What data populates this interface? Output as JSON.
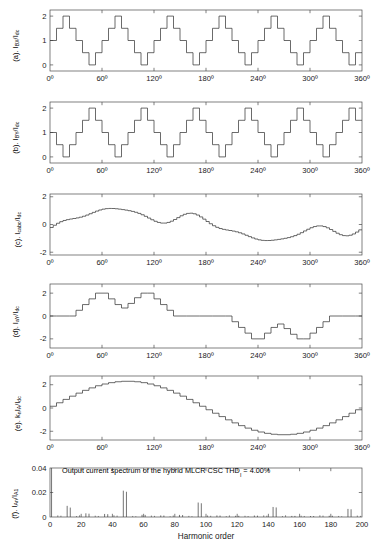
{
  "figure": {
    "width": 377,
    "height": 547,
    "background": "#ffffff",
    "line_color": "#3a3a3a",
    "axis_color": "#4a4a4a",
    "text_color": "#1a1a1a"
  },
  "xaxis_title": "Harmonic order",
  "angle_ticks": [
    "0º",
    "60º",
    "120º",
    "180º",
    "240º",
    "300º",
    "360º"
  ],
  "angle_tick_values": [
    0,
    60,
    120,
    180,
    240,
    300,
    360
  ],
  "annotation": {
    "text_part1": "Output current spectrum of the hybrid MLCR CSC THD",
    "subscript": "I",
    "text_part2": " = 4.00%",
    "full": "Output current spectrum of the hybrid MLCR CSC THD_I = 4.00%"
  },
  "panels": [
    {
      "id": "a",
      "label_prefix": "(a). I",
      "label_sub1": "BX",
      "label_mid": "/I",
      "label_sub2": "dc",
      "label_full": "(a). I_BX/I_dc",
      "ylim": [
        -0.25,
        2.25
      ],
      "yticks": [
        0,
        1,
        2
      ],
      "ytick_labels": [
        "0",
        "1",
        "2"
      ],
      "xlim": [
        0,
        360
      ],
      "type": "line"
    },
    {
      "id": "b",
      "label_prefix": "(b). I",
      "label_sub1": "BY",
      "label_mid": "/I",
      "label_sub2": "dc",
      "label_full": "(b). I_BY/I_dc",
      "ylim": [
        -0.25,
        2.25
      ],
      "yticks": [
        0,
        1,
        2
      ],
      "ytick_labels": [
        "0",
        "1",
        "2"
      ],
      "xlim": [
        0,
        360
      ],
      "type": "line"
    },
    {
      "id": "c",
      "label_prefix": "(c). I",
      "label_sub1": "cabc",
      "label_mid": "/I",
      "label_sub2": "dc",
      "label_full": "(c). I_cabc/I_dc",
      "ylim": [
        -2.2,
        2.2
      ],
      "yticks": [
        -2,
        0,
        2
      ],
      "ytick_labels": [
        "-2",
        "0",
        "2"
      ],
      "xlim": [
        0,
        360
      ],
      "type": "line"
    },
    {
      "id": "d",
      "label_prefix": "(d). I",
      "label_sub1": "aY",
      "label_mid": "/I",
      "label_sub2": "dc",
      "label_full": "(d). I_aY/I_dc",
      "ylim": [
        -2.8,
        2.8
      ],
      "yticks": [
        -2,
        0,
        2
      ],
      "ytick_labels": [
        "-2",
        "0",
        "2"
      ],
      "xlim": [
        0,
        360
      ],
      "type": "line"
    },
    {
      "id": "e",
      "label_prefix": "(e). k",
      "label_sub1": "n",
      "label_mid": "I",
      "label_sub1b": "A",
      "label_mid2": "/I",
      "label_sub2": "dc",
      "label_full": "(e). k_n I_A/I_dc",
      "ylim": [
        -2.75,
        2.75
      ],
      "yticks": [
        -2,
        0,
        2
      ],
      "ytick_labels": [
        "-2",
        "0",
        "2"
      ],
      "xlim": [
        0,
        360
      ],
      "type": "line"
    },
    {
      "id": "f",
      "label_prefix": "(f). I",
      "label_sub1": "An",
      "label_mid": "/I",
      "label_sub2": "A1",
      "label_full": "(f). I_An/I_A1",
      "ylim": [
        0,
        0.04
      ],
      "yticks": [
        0,
        0.02,
        0.04
      ],
      "ytick_labels": [
        "0",
        "0.02",
        "0.04"
      ],
      "xlim": [
        0,
        200
      ],
      "xticks": [
        0,
        20,
        40,
        60,
        80,
        100,
        120,
        140,
        160,
        180,
        200
      ],
      "xtick_labels": [
        "0",
        "20",
        "40",
        "60",
        "80",
        "100",
        "120",
        "140",
        "160",
        "180",
        "200"
      ],
      "type": "stem"
    }
  ],
  "chart_data": [
    {
      "type": "line",
      "panel": "a",
      "title": "(a). I_BX/I_dc",
      "xlabel": "",
      "ylabel": "I_BX/I_dc",
      "xlim": [
        0,
        360
      ],
      "ylim": [
        -0.25,
        2.25
      ],
      "grid": false,
      "step_period_deg": 60,
      "step_width_deg": 7.5,
      "step_levels_one_period": [
        0.5,
        1.0,
        1.5,
        2.0,
        1.5,
        1.0,
        0.5,
        0.0
      ],
      "phase_offset_deg": -7.5,
      "description": "Eight-step staircase repeating every 60 degrees, levels 0 to 2 in 0.5 increments"
    },
    {
      "type": "line",
      "panel": "b",
      "title": "(b). I_BY/I_dc",
      "xlabel": "",
      "ylabel": "I_BY/I_dc",
      "xlim": [
        0,
        360
      ],
      "ylim": [
        -0.25,
        2.25
      ],
      "grid": false,
      "step_period_deg": 60,
      "step_width_deg": 7.5,
      "step_levels_one_period": [
        0.5,
        1.0,
        1.5,
        2.0,
        1.5,
        1.0,
        0.5,
        0.0
      ],
      "phase_offset_deg": 22.5,
      "description": "Same staircase as (a) shifted by 30 degrees so peaks occur at 60,120,180,240,300"
    },
    {
      "type": "line",
      "panel": "c",
      "title": "(c). I_cabc/I_dc",
      "xlabel": "",
      "ylabel": "I_cabc/I_dc",
      "xlim": [
        0,
        360
      ],
      "ylim": [
        -2.2,
        2.2
      ],
      "grid": false,
      "peaks": [
        {
          "x": 30,
          "y": 0.65
        },
        {
          "x": 90,
          "y": 1.3
        },
        {
          "x": 150,
          "y": 0.65
        }
      ],
      "troughs": [
        {
          "x": 210,
          "y": -0.75
        },
        {
          "x": 270,
          "y": -1.35
        },
        {
          "x": 330,
          "y": -0.6
        }
      ],
      "description": "Irregular ripple waveform, positive humps in first half, negative in second half, max ~1.3 at 90deg, min ~-1.4 at 270deg"
    },
    {
      "type": "line",
      "panel": "d",
      "title": "(d). I_aY/I_dc",
      "xlabel": "",
      "ylabel": "I_aY/I_dc",
      "xlim": [
        0,
        360
      ],
      "ylim": [
        -2.8,
        2.8
      ],
      "grid": false,
      "zero_segments_deg": [
        [
          0,
          30
        ],
        [
          150,
          210
        ],
        [
          330,
          360
        ]
      ],
      "positive_lobe_deg": [
        30,
        150
      ],
      "negative_lobe_deg": [
        210,
        330
      ],
      "peak_value": 2.0,
      "trough_value": -2.0,
      "description": "Quasi-square staircase with zero intervals, twin humps reaching +2 near 60 and 120 deg and -2 near 240 and 300 deg"
    },
    {
      "type": "line",
      "panel": "e",
      "title": "(e). k_n I_A/I_dc",
      "xlabel": "",
      "ylabel": "k_n I_A/I_dc",
      "xlim": [
        0,
        360
      ],
      "ylim": [
        -2.75,
        2.75
      ],
      "grid": false,
      "amplitude": 2.3,
      "n_steps": 48,
      "description": "Finely quantized staircase sine wave, amplitude approx 2.3, zero crossings at 0, 180 and 360 deg, peak at 90 deg, trough at 270 deg"
    },
    {
      "type": "stem",
      "panel": "f",
      "title": "Output current spectrum of the hybrid MLCR CSC THD_I = 4.00%",
      "xlabel": "Harmonic order",
      "ylabel": "I_An/I_A1",
      "xlim": [
        0,
        200
      ],
      "ylim": [
        0,
        0.04
      ],
      "grid": false,
      "harmonics": [
        1,
        11,
        13,
        23,
        25,
        35,
        37,
        47,
        49,
        59,
        61,
        71,
        73,
        83,
        85,
        95,
        97,
        107,
        109,
        119,
        121,
        131,
        133,
        143,
        145,
        155,
        157,
        167,
        169,
        179,
        181,
        191,
        193
      ],
      "magnitudes": [
        0.04,
        0.0091,
        0.0077,
        0.003,
        0.0027,
        0.0025,
        0.0023,
        0.0215,
        0.0206,
        0.0018,
        0.0017,
        0.0013,
        0.0012,
        0.0017,
        0.0016,
        0.0118,
        0.0112,
        0.0013,
        0.0012,
        0.001,
        0.001,
        0.0012,
        0.0011,
        0.0082,
        0.0078,
        0.0009,
        0.0009,
        0.0008,
        0.0008,
        0.001,
        0.001,
        0.0066,
        0.0063
      ],
      "thd_percent": 4.0,
      "description": "Harmonic spectrum normalized to fundamental; dominant clusters at 47/49, 95/97, 143/145, 191/193"
    }
  ]
}
